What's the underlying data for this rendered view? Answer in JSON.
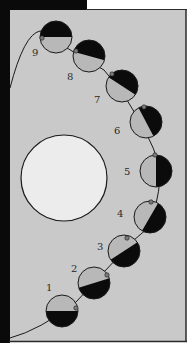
{
  "diagram": {
    "type": "moon-phases-orbit",
    "colors": {
      "panel_background": "#c9c9c9",
      "frame_black": "#0a0a0a",
      "page_white": "#ffffff",
      "central_body_fill": "#ececec",
      "lit_half": "#b8b8b8",
      "dark_half": "#0b0b0b",
      "outline": "#1a1a1a",
      "marker": "#7a7a7a",
      "label": "#2a2a2a"
    },
    "central_body": {
      "cx": 64,
      "cy": 178,
      "r": 43
    },
    "phases": [
      {
        "label": "1",
        "cx": 62,
        "cy": 311,
        "r": 16,
        "angle": 0,
        "marker": {
          "dx": 14,
          "dy": -3
        },
        "label_x": 46,
        "label_y": 291
      },
      {
        "label": "2",
        "cx": 94,
        "cy": 283,
        "r": 16,
        "angle": -17,
        "marker": {
          "dx": 13,
          "dy": -8
        },
        "label_x": 71,
        "label_y": 272
      },
      {
        "label": "3",
        "cx": 124,
        "cy": 251,
        "r": 16,
        "angle": -33,
        "marker": {
          "dx": 3,
          "dy": -13
        },
        "label_x": 97,
        "label_y": 250
      },
      {
        "label": "4",
        "cx": 150,
        "cy": 217,
        "r": 16,
        "angle": -60,
        "marker": {
          "dx": 1,
          "dy": -15
        },
        "label_x": 117,
        "label_y": 217
      },
      {
        "label": "5",
        "cx": 156,
        "cy": 171,
        "r": 16,
        "angle": -90,
        "marker": {
          "dx": -1,
          "dy": -16
        },
        "label_x": 124,
        "label_y": 175
      },
      {
        "label": "6",
        "cx": 146,
        "cy": 122,
        "r": 16,
        "angle": -118,
        "marker": {
          "dx": -2,
          "dy": -15
        },
        "label_x": 114,
        "label_y": 134
      },
      {
        "label": "7",
        "cx": 122,
        "cy": 86,
        "r": 16,
        "angle": -147,
        "marker": {
          "dx": -10,
          "dy": -12
        },
        "label_x": 94,
        "label_y": 103
      },
      {
        "label": "8",
        "cx": 89,
        "cy": 56,
        "r": 16,
        "angle": -165,
        "marker": {
          "dx": -13,
          "dy": -5
        },
        "label_x": 67,
        "label_y": 80
      },
      {
        "label": "9",
        "cx": 56,
        "cy": 37,
        "r": 16,
        "angle": 180,
        "marker": {
          "dx": -14,
          "dy": 1
        },
        "label_x": 32,
        "label_y": 56
      }
    ],
    "orbit_path": "M 10 88 Q 24 34, 40 31 L 44 32 Q 60 44, 72 51 L 104 70 Q 130 100, 148 137 Q 160 160, 160 178 Q 158 205, 148 228 L 134 240 L 104 272 L 76 302 Q 40 330, 10 338"
  }
}
